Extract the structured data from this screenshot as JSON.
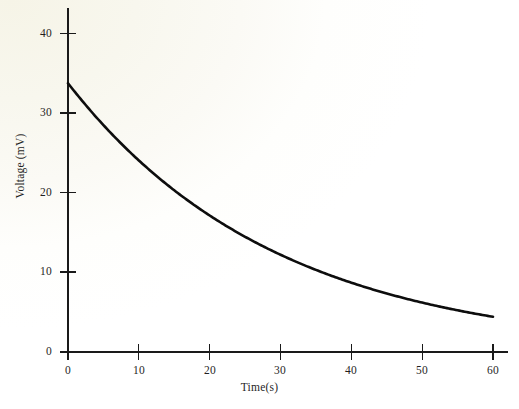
{
  "chart_data": {
    "type": "line",
    "title": "",
    "xlabel": "Time(s)",
    "ylabel": "Voltage (mV)",
    "xlim": [
      0,
      60
    ],
    "ylim": [
      0,
      43
    ],
    "xticks": [
      0,
      10,
      20,
      30,
      40,
      50,
      60
    ],
    "xtick_labels": [
      "0",
      "10",
      "20",
      "30",
      "40",
      "50",
      "60"
    ],
    "yticks": [
      0,
      10,
      20,
      30,
      40
    ],
    "ytick_labels": [
      "0",
      "10",
      "20",
      "30",
      "40"
    ],
    "grid": false,
    "legend": false,
    "series": [
      {
        "name": "Voltage decay",
        "color": "#0d0d0d",
        "x": [
          0,
          2,
          4,
          6,
          8,
          10,
          12,
          14,
          16,
          18,
          20,
          22,
          24,
          26,
          28,
          30,
          32,
          34,
          36,
          38,
          40,
          42,
          44,
          46,
          48,
          50,
          52,
          54,
          56,
          58,
          60
        ],
        "values": [
          33.6,
          31.4,
          29.4,
          27.5,
          25.7,
          26.2,
          22.4,
          21.0,
          19.6,
          18.3,
          18.1,
          16.0,
          15.0,
          14.0,
          13.1,
          12.6,
          11.4,
          10.7,
          10.0,
          9.3,
          8.8,
          8.2,
          7.6,
          7.1,
          6.7,
          6.2,
          5.8,
          5.4,
          5.1,
          4.8,
          4.4
        ]
      }
    ],
    "annotations": []
  },
  "axes": {
    "x_title": "Time(s)",
    "y_title": "Voltage (mV)"
  },
  "colors": {
    "curve": "#0d0d0d",
    "axis": "#1a1a1a",
    "background": "#fbfaf5",
    "text": "#1f1f1f"
  }
}
